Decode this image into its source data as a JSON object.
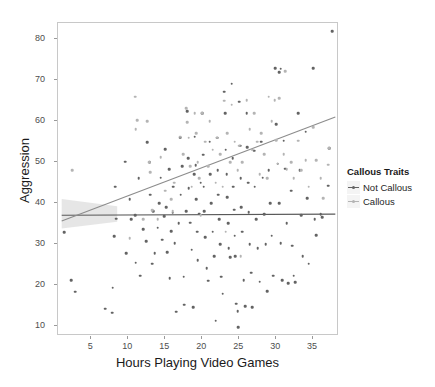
{
  "chart_data": {
    "type": "scatter",
    "title": "",
    "xlabel": "Hours Playing Video Games",
    "ylabel": "Aggression",
    "xlim": [
      0.5,
      38.5
    ],
    "ylim": [
      7.5,
      84.0
    ],
    "xticks": [
      5,
      10,
      15,
      20,
      25,
      30,
      35
    ],
    "yticks": [
      10,
      20,
      30,
      40,
      50,
      60,
      70,
      80
    ],
    "grid": false,
    "legend": {
      "title": "Callous Traits",
      "position": "right",
      "entries": [
        {
          "name": "Not Callous",
          "color": "#636363"
        },
        {
          "name": "Callous",
          "color": "#b4b4b4"
        }
      ]
    },
    "fit_lines": [
      {
        "name": "Not Callous",
        "color": "#595959",
        "x": [
          1.0,
          38.0
        ],
        "y": [
          37.0,
          37.3
        ],
        "slope": 0.008,
        "intercept": 37.0
      },
      {
        "name": "Callous",
        "color": "#8c8c8c",
        "x": [
          1.0,
          38.0
        ],
        "y": [
          35.6,
          61.0
        ],
        "slope": 0.686,
        "intercept": 34.9
      }
    ],
    "confidence_band": {
      "color": "#e2e2e2",
      "x": [
        1.0,
        8.5
      ],
      "ymin": [
        33.8,
        35.4
      ],
      "ymax": [
        41.0,
        39.2
      ]
    },
    "series": [
      {
        "name": "Not Callous",
        "color": "#636363",
        "points": [
          [
            1.3,
            32.8
          ],
          [
            2.3,
            21.1
          ],
          [
            2.8,
            18.3
          ],
          [
            6.9,
            14.2
          ],
          [
            7.8,
            13.2
          ],
          [
            7.9,
            19.3
          ],
          [
            8.1,
            31.9
          ],
          [
            8.2,
            44.0
          ],
          [
            8.4,
            36.2
          ],
          [
            9.6,
            50.1
          ],
          [
            9.7,
            27.8
          ],
          [
            10.2,
            41.0
          ],
          [
            10.4,
            36.1
          ],
          [
            10.9,
            37.0
          ],
          [
            11.0,
            25.4
          ],
          [
            11.4,
            46.0
          ],
          [
            11.6,
            22.2
          ],
          [
            12.0,
            33.6
          ],
          [
            12.4,
            30.6
          ],
          [
            12.6,
            54.8
          ],
          [
            12.9,
            50.0
          ],
          [
            13.0,
            42.0
          ],
          [
            13.2,
            25.2
          ],
          [
            13.4,
            38.0
          ],
          [
            13.6,
            27.8
          ],
          [
            14.0,
            34.0
          ],
          [
            14.2,
            40.0
          ],
          [
            14.4,
            46.2
          ],
          [
            14.6,
            31.0
          ],
          [
            14.9,
            36.8
          ],
          [
            15.0,
            53.2
          ],
          [
            15.1,
            39.0
          ],
          [
            15.3,
            28.0
          ],
          [
            15.5,
            48.2
          ],
          [
            15.6,
            21.6
          ],
          [
            15.8,
            33.1
          ],
          [
            16.0,
            37.6
          ],
          [
            16.1,
            44.0
          ],
          [
            16.3,
            30.2
          ],
          [
            16.5,
            13.4
          ],
          [
            16.8,
            35.0
          ],
          [
            17.0,
            56.0
          ],
          [
            17.1,
            42.0
          ],
          [
            17.3,
            49.0
          ],
          [
            17.5,
            22.0
          ],
          [
            17.6,
            15.2
          ],
          [
            17.8,
            38.0
          ],
          [
            18.0,
            62.4
          ],
          [
            18.1,
            51.0
          ],
          [
            18.2,
            43.6
          ],
          [
            18.4,
            35.2
          ],
          [
            18.6,
            28.6
          ],
          [
            18.8,
            14.6
          ],
          [
            18.9,
            47.0
          ],
          [
            19.0,
            56.2
          ],
          [
            19.1,
            49.2
          ],
          [
            19.2,
            41.0
          ],
          [
            19.3,
            33.0
          ],
          [
            19.4,
            26.0
          ],
          [
            19.6,
            37.4
          ],
          [
            19.8,
            45.0
          ],
          [
            20.0,
            62.0
          ],
          [
            20.1,
            51.8
          ],
          [
            20.2,
            44.0
          ],
          [
            20.3,
            38.0
          ],
          [
            20.4,
            31.6
          ],
          [
            20.6,
            24.0
          ],
          [
            20.8,
            21.0
          ],
          [
            21.0,
            55.0
          ],
          [
            21.1,
            47.0
          ],
          [
            21.2,
            40.0
          ],
          [
            21.4,
            33.0
          ],
          [
            21.6,
            27.0
          ],
          [
            21.8,
            11.2
          ],
          [
            22.0,
            56.0
          ],
          [
            22.1,
            48.0
          ],
          [
            22.2,
            42.0
          ],
          [
            22.3,
            36.0
          ],
          [
            22.4,
            30.0
          ],
          [
            22.6,
            22.0
          ],
          [
            22.8,
            17.8
          ],
          [
            23.0,
            67.2
          ],
          [
            23.1,
            62.0
          ],
          [
            23.2,
            53.0
          ],
          [
            23.3,
            47.0
          ],
          [
            23.4,
            41.4
          ],
          [
            23.5,
            35.0
          ],
          [
            23.6,
            29.0
          ],
          [
            23.8,
            26.8
          ],
          [
            24.0,
            69.2
          ],
          [
            24.1,
            51.0
          ],
          [
            24.2,
            44.0
          ],
          [
            24.3,
            38.4
          ],
          [
            24.4,
            32.0
          ],
          [
            24.5,
            27.0
          ],
          [
            24.6,
            15.4
          ],
          [
            24.8,
            13.6
          ],
          [
            24.9,
            9.6
          ],
          [
            25.0,
            64.8
          ],
          [
            25.1,
            54.0
          ],
          [
            25.2,
            46.0
          ],
          [
            25.3,
            39.0
          ],
          [
            25.4,
            33.0
          ],
          [
            25.6,
            21.2
          ],
          [
            25.8,
            14.8
          ],
          [
            26.0,
            62.0
          ],
          [
            26.1,
            53.6
          ],
          [
            26.2,
            45.0
          ],
          [
            26.3,
            37.8
          ],
          [
            26.4,
            30.0
          ],
          [
            26.6,
            23.0
          ],
          [
            26.8,
            14.6
          ],
          [
            27.0,
            52.8
          ],
          [
            27.1,
            44.0
          ],
          [
            27.3,
            36.0
          ],
          [
            27.5,
            29.0
          ],
          [
            27.8,
            20.8
          ],
          [
            28.0,
            55.0
          ],
          [
            28.2,
            46.2
          ],
          [
            28.4,
            37.2
          ],
          [
            28.6,
            30.0
          ],
          [
            28.8,
            18.4
          ],
          [
            29.0,
            48.0
          ],
          [
            29.2,
            40.0
          ],
          [
            29.4,
            32.0
          ],
          [
            29.6,
            22.2
          ],
          [
            30.0,
            59.2
          ],
          [
            30.2,
            49.6
          ],
          [
            30.4,
            40.0
          ],
          [
            30.6,
            30.2
          ],
          [
            30.8,
            21.2
          ],
          [
            31.0,
            55.2
          ],
          [
            31.2,
            48.4
          ],
          [
            31.4,
            35.0
          ],
          [
            31.6,
            20.4
          ],
          [
            32.0,
            43.0
          ],
          [
            32.2,
            29.6
          ],
          [
            32.4,
            22.2
          ],
          [
            32.6,
            20.6
          ],
          [
            33.0,
            62.0
          ],
          [
            33.2,
            48.0
          ],
          [
            33.4,
            37.0
          ],
          [
            33.6,
            27.0
          ],
          [
            34.0,
            57.4
          ],
          [
            34.2,
            41.2
          ],
          [
            34.4,
            25.2
          ],
          [
            35.0,
            73.0
          ],
          [
            35.2,
            36.0
          ],
          [
            35.4,
            32.2
          ],
          [
            36.0,
            37.2
          ],
          [
            36.2,
            36.6
          ],
          [
            37.0,
            44.2
          ],
          [
            37.2,
            53.4
          ],
          [
            29.9,
            73.0
          ],
          [
            30.6,
            72.8
          ],
          [
            30.4,
            72.0
          ],
          [
            37.6,
            82.0
          ]
        ]
      },
      {
        "name": "Callous",
        "color": "#b4b4b4",
        "points": [
          [
            2.4,
            48.0
          ],
          [
            10.9,
            66.0
          ],
          [
            11.0,
            58.0
          ],
          [
            11.2,
            60.2
          ],
          [
            12.6,
            60.0
          ],
          [
            12.8,
            50.0
          ],
          [
            13.0,
            47.6
          ],
          [
            14.4,
            51.2
          ],
          [
            15.0,
            43.0
          ],
          [
            15.8,
            41.0
          ],
          [
            16.2,
            45.0
          ],
          [
            17.0,
            56.2
          ],
          [
            17.4,
            52.0
          ],
          [
            17.8,
            63.2
          ],
          [
            18.0,
            59.8
          ],
          [
            18.2,
            56.0
          ],
          [
            18.4,
            49.0
          ],
          [
            18.6,
            44.0
          ],
          [
            19.0,
            62.0
          ],
          [
            19.2,
            57.0
          ],
          [
            19.4,
            50.0
          ],
          [
            19.6,
            46.0
          ],
          [
            20.0,
            62.0
          ],
          [
            20.4,
            55.0
          ],
          [
            20.8,
            49.0
          ],
          [
            21.0,
            60.0
          ],
          [
            21.4,
            53.0
          ],
          [
            21.8,
            45.0
          ],
          [
            22.0,
            56.0
          ],
          [
            22.4,
            52.0
          ],
          [
            22.8,
            44.0
          ],
          [
            23.0,
            65.0
          ],
          [
            23.4,
            57.0
          ],
          [
            23.8,
            50.0
          ],
          [
            24.0,
            64.0
          ],
          [
            24.4,
            55.0
          ],
          [
            24.8,
            48.0
          ],
          [
            25.0,
            54.0
          ],
          [
            25.4,
            50.0
          ],
          [
            26.0,
            65.2
          ],
          [
            26.4,
            58.0
          ],
          [
            26.8,
            53.0
          ],
          [
            27.0,
            62.0
          ],
          [
            27.4,
            55.0
          ],
          [
            27.8,
            47.0
          ],
          [
            28.0,
            57.0
          ],
          [
            28.4,
            52.0
          ],
          [
            28.8,
            46.0
          ],
          [
            29.0,
            66.0
          ],
          [
            29.4,
            60.0
          ],
          [
            29.8,
            65.2
          ],
          [
            30.0,
            55.4
          ],
          [
            30.2,
            49.6
          ],
          [
            31.0,
            52.0
          ],
          [
            31.4,
            48.2
          ],
          [
            32.0,
            50.0
          ],
          [
            32.4,
            46.0
          ],
          [
            33.0,
            55.2
          ],
          [
            33.4,
            48.0
          ],
          [
            34.0,
            50.4
          ],
          [
            34.4,
            44.0
          ],
          [
            35.0,
            58.6
          ],
          [
            35.4,
            50.4
          ],
          [
            36.0,
            46.0
          ],
          [
            36.4,
            41.2
          ],
          [
            37.0,
            49.4
          ],
          [
            37.2,
            53.4
          ],
          [
            13.2,
            38.2
          ],
          [
            16.0,
            38.0
          ],
          [
            19.8,
            37.0
          ],
          [
            23.2,
            33.0
          ],
          [
            25.2,
            27.0
          ],
          [
            30.4,
            65.6
          ],
          [
            31.2,
            72.2
          ],
          [
            14.0,
            36.0
          ],
          [
            10.2,
            31.4
          ],
          [
            12.0,
            36.0
          ]
        ]
      }
    ]
  }
}
